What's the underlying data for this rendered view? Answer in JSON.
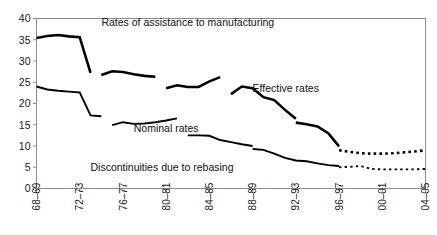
{
  "chart_data": {
    "type": "line",
    "title": "Rates of assistance to manufacturing",
    "xlabel": "",
    "ylabel": "",
    "ylim": [
      0,
      40
    ],
    "yticks": [
      0,
      5,
      10,
      15,
      20,
      25,
      30,
      35,
      40
    ],
    "grid": false,
    "legend_position": "inline-annotation",
    "categories": [
      "68-69",
      "69-70",
      "70-71",
      "71-72",
      "72-73",
      "73-74",
      "74-75",
      "75-76",
      "76-77",
      "77-78",
      "78-79",
      "79-80",
      "80-81",
      "81-82",
      "82-83",
      "83-84",
      "84-85",
      "85-86",
      "86-87",
      "87-88",
      "88-89",
      "89-90",
      "90-91",
      "91-92",
      "92-93",
      "93-94",
      "94-95",
      "95-96",
      "96-97",
      "97-98",
      "98-99",
      "99-00",
      "00-01",
      "01-02",
      "02-03",
      "03-04",
      "04-05"
    ],
    "xticks": [
      "68-69",
      "72-73",
      "76-77",
      "80-81",
      "84-85",
      "88-89",
      "92-93",
      "96-97",
      "00-01",
      "04-05"
    ],
    "xtick_labels": [
      "68–69",
      "72–73",
      "76–77",
      "80–81",
      "84–85",
      "88–89",
      "92–93",
      "96–97",
      "00–01",
      "04–05"
    ],
    "annotations": [
      {
        "text": "Rates of assistance to manufacturing",
        "x": "82-83",
        "y": 38.2,
        "name": "chart-title-annotation"
      },
      {
        "text": "Effective rates",
        "x": "88-89",
        "y": 22.8,
        "name": "effective-rates-label"
      },
      {
        "text": "Nominal rates",
        "x": "77-78",
        "y": 13.2,
        "name": "nominal-rates-label"
      },
      {
        "text": "Discontinuities due to rebasing",
        "x": "73-74",
        "y": 4.2,
        "name": "discontinuities-note"
      }
    ],
    "series": [
      {
        "name": "Effective rates",
        "style": "solid",
        "linewidth": "thick",
        "segments": [
          {
            "label": "1968-69 to 1973-74",
            "points": [
              {
                "x": "68-69",
                "y": 35.4
              },
              {
                "x": "69-70",
                "y": 35.9
              },
              {
                "x": "70-71",
                "y": 36.1
              },
              {
                "x": "71-72",
                "y": 35.8
              },
              {
                "x": "72-73",
                "y": 35.6
              },
              {
                "x": "73-74",
                "y": 27.2
              }
            ]
          },
          {
            "label": "1974-75 to 1979-80",
            "points": [
              {
                "x": "74-75",
                "y": 26.7
              },
              {
                "x": "75-76",
                "y": 27.6
              },
              {
                "x": "76-77",
                "y": 27.4
              },
              {
                "x": "77-78",
                "y": 26.9
              },
              {
                "x": "78-79",
                "y": 26.5
              },
              {
                "x": "79-80",
                "y": 26.3
              }
            ]
          },
          {
            "label": "1980-81 to 1984-85",
            "points": [
              {
                "x": "80-81",
                "y": 23.6
              },
              {
                "x": "81-82",
                "y": 24.3
              },
              {
                "x": "82-83",
                "y": 23.9
              },
              {
                "x": "83-84",
                "y": 23.9
              },
              {
                "x": "84-85",
                "y": 25.2
              },
              {
                "x": "85-86",
                "y": 26.2
              }
            ]
          },
          {
            "label": "1986-87 to 1988-89",
            "points": [
              {
                "x": "86-87",
                "y": 22.2
              },
              {
                "x": "87-88",
                "y": 24.0
              },
              {
                "x": "88-89",
                "y": 23.6
              },
              {
                "x": "89-90",
                "y": 21.5
              },
              {
                "x": "90-91",
                "y": 20.8
              },
              {
                "x": "91-92",
                "y": 18.5
              },
              {
                "x": "92-93",
                "y": 16.4
              }
            ]
          },
          {
            "label": "1993-94 to 1996-97",
            "points": [
              {
                "x": "92-93",
                "y": 15.5
              },
              {
                "x": "93-94",
                "y": 15.1
              },
              {
                "x": "94-95",
                "y": 14.6
              },
              {
                "x": "95-96",
                "y": 13.0
              },
              {
                "x": "96-97",
                "y": 9.9
              }
            ]
          }
        ],
        "projection": {
          "style": "dotted",
          "points": [
            {
              "x": "96-97",
              "y": 9.0
            },
            {
              "x": "97-98",
              "y": 8.6
            },
            {
              "x": "98-99",
              "y": 8.3
            },
            {
              "x": "99-00",
              "y": 8.2
            },
            {
              "x": "00-01",
              "y": 8.2
            },
            {
              "x": "01-02",
              "y": 8.3
            },
            {
              "x": "02-03",
              "y": 8.5
            },
            {
              "x": "03-04",
              "y": 8.7
            },
            {
              "x": "04-05",
              "y": 9.0
            }
          ]
        }
      },
      {
        "name": "Nominal rates",
        "style": "solid",
        "linewidth": "thin",
        "segments": [
          {
            "label": "1968-69 to 1973-74",
            "points": [
              {
                "x": "68-69",
                "y": 24.0
              },
              {
                "x": "69-70",
                "y": 23.3
              },
              {
                "x": "70-71",
                "y": 23.0
              },
              {
                "x": "71-72",
                "y": 22.8
              },
              {
                "x": "72-73",
                "y": 22.6
              },
              {
                "x": "73-74",
                "y": 17.2
              },
              {
                "x": "74-75",
                "y": 17.0
              }
            ]
          },
          {
            "label": "1975-76 to 1980-81",
            "points": [
              {
                "x": "75-76",
                "y": 14.9
              },
              {
                "x": "76-77",
                "y": 15.6
              },
              {
                "x": "77-78",
                "y": 15.2
              },
              {
                "x": "78-79",
                "y": 15.3
              },
              {
                "x": "79-80",
                "y": 15.6
              },
              {
                "x": "80-81",
                "y": 16.0
              },
              {
                "x": "81-82",
                "y": 16.5
              }
            ]
          },
          {
            "label": "1982-83 to 1988-89",
            "points": [
              {
                "x": "82-83",
                "y": 12.5
              },
              {
                "x": "83-84",
                "y": 12.5
              },
              {
                "x": "84-85",
                "y": 12.4
              },
              {
                "x": "85-86",
                "y": 11.4
              },
              {
                "x": "86-87",
                "y": 10.9
              },
              {
                "x": "87-88",
                "y": 10.4
              },
              {
                "x": "88-89",
                "y": 10.0
              }
            ]
          },
          {
            "label": "1989-90 to 1996-97",
            "points": [
              {
                "x": "88-89",
                "y": 9.3
              },
              {
                "x": "89-90",
                "y": 9.1
              },
              {
                "x": "90-91",
                "y": 8.2
              },
              {
                "x": "91-92",
                "y": 7.2
              },
              {
                "x": "92-93",
                "y": 6.6
              },
              {
                "x": "93-94",
                "y": 6.4
              },
              {
                "x": "94-95",
                "y": 5.9
              },
              {
                "x": "95-96",
                "y": 5.5
              },
              {
                "x": "96-97",
                "y": 5.3
              }
            ]
          }
        ],
        "projection": {
          "style": "dotted",
          "points": [
            {
              "x": "96-97",
              "y": 5.0
            },
            {
              "x": "97-98",
              "y": 5.1
            },
            {
              "x": "98-99",
              "y": 5.3
            },
            {
              "x": "99-00",
              "y": 4.6
            },
            {
              "x": "00-01",
              "y": 4.5
            },
            {
              "x": "01-02",
              "y": 4.5
            },
            {
              "x": "02-03",
              "y": 4.5
            },
            {
              "x": "03-04",
              "y": 4.5
            },
            {
              "x": "04-05",
              "y": 4.6
            }
          ]
        }
      }
    ]
  }
}
